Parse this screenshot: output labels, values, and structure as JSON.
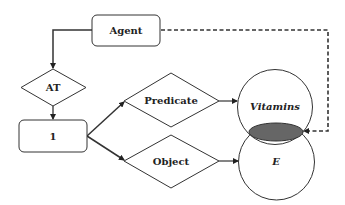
{
  "diagram": {
    "nodes": {
      "agent": {
        "label": "Agent",
        "shape": "rounded-rectangle"
      },
      "at": {
        "label": "AT",
        "shape": "diamond"
      },
      "one": {
        "label": "1",
        "shape": "rounded-rectangle"
      },
      "predicate": {
        "label": "Predicate",
        "shape": "diamond"
      },
      "object": {
        "label": "Object",
        "shape": "diamond"
      },
      "vitamins": {
        "label": "Vitamins",
        "shape": "circle"
      },
      "e": {
        "label": "E",
        "shape": "circle"
      },
      "intersection": {
        "label": "",
        "shape": "lens",
        "fill": "#666666"
      }
    },
    "edges": [
      {
        "from": "agent",
        "to": "at",
        "style": "solid"
      },
      {
        "from": "at",
        "to": "one",
        "style": "solid"
      },
      {
        "from": "one",
        "to": "predicate",
        "style": "solid"
      },
      {
        "from": "one",
        "to": "object",
        "style": "solid"
      },
      {
        "from": "predicate",
        "to": "vitamins",
        "style": "solid"
      },
      {
        "from": "object",
        "to": "e",
        "style": "solid"
      },
      {
        "from": "agent",
        "to": "intersection",
        "style": "dashed"
      }
    ],
    "colors": {
      "stroke": "#333333",
      "lens_fill": "#666666",
      "background": "#ffffff"
    }
  }
}
